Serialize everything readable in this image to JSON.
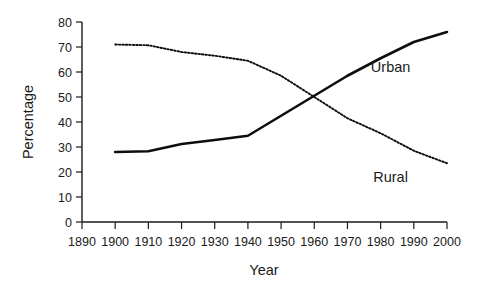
{
  "chart_data": {
    "type": "line",
    "title": "",
    "xlabel": "Year",
    "ylabel": "Percentage",
    "xlim": [
      1890,
      2000
    ],
    "ylim": [
      0,
      80
    ],
    "grid": false,
    "legend_position": "inline-annotation",
    "x_ticks": [
      1890,
      1900,
      1910,
      1920,
      1930,
      1940,
      1950,
      1960,
      1970,
      1980,
      1990,
      2000
    ],
    "y_ticks": [
      0,
      10,
      20,
      30,
      40,
      50,
      60,
      70,
      80
    ],
    "x": [
      1900,
      1910,
      1920,
      1930,
      1940,
      1950,
      1960,
      1970,
      1980,
      1990,
      2000
    ],
    "series": [
      {
        "name": "Urban",
        "style": "solid",
        "color": "#0d0d0d",
        "values": [
          28,
          28.3,
          31.2,
          32.8,
          34.5,
          42.5,
          50.5,
          58.5,
          65.5,
          72,
          76
        ]
      },
      {
        "name": "Rural",
        "style": "dotted",
        "color": "#0d0d0d",
        "values": [
          71,
          70.7,
          68,
          66.5,
          64.5,
          58.5,
          50,
          41.5,
          35.5,
          28.5,
          23.5
        ]
      }
    ],
    "annotations": [
      {
        "text": "Urban",
        "x": 1983,
        "y": 60
      },
      {
        "text": "Rural",
        "x": 1983,
        "y": 16
      }
    ]
  }
}
